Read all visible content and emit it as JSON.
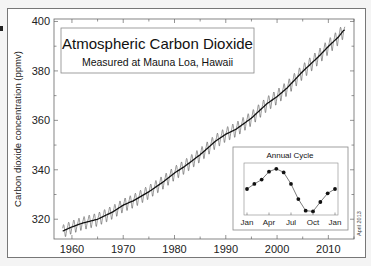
{
  "chart_data": {
    "type": "line",
    "title": "Atmospheric Carbon Dioxide",
    "subtitle": "Measured at Mauna Loa, Hawaii",
    "xlabel": "",
    "ylabel": "Carbon dioxide concentration (ppmv)",
    "xlim": [
      1956.5,
      2015
    ],
    "ylim": [
      312,
      401
    ],
    "x_ticks": [
      1960,
      1970,
      1980,
      1990,
      2000,
      2010
    ],
    "y_ticks": [
      320,
      340,
      360,
      380,
      400
    ],
    "grid": false,
    "annotation": "April 2013",
    "series": [
      {
        "name": "Trend (annual mean)",
        "style": "thick line",
        "x": [
          1958,
          1960,
          1962,
          1965,
          1968,
          1970,
          1972,
          1975,
          1978,
          1980,
          1982,
          1985,
          1988,
          1990,
          1992,
          1995,
          1998,
          2000,
          2002,
          2005,
          2008,
          2010,
          2012,
          2013
        ],
        "values": [
          315.0,
          316.9,
          318.4,
          320.0,
          323.0,
          325.7,
          327.5,
          331.1,
          335.4,
          338.7,
          341.4,
          346.1,
          351.6,
          354.4,
          356.4,
          360.9,
          366.7,
          369.6,
          373.2,
          379.8,
          385.6,
          389.9,
          393.8,
          396.5
        ]
      },
      {
        "name": "Monthly mean",
        "style": "thin seasonal oscillation",
        "seasonal_amplitude_ppm": 3.2
      }
    ],
    "inset": {
      "type": "line",
      "title": "Annual Cycle",
      "categories": [
        "Jan",
        "Feb",
        "Mar",
        "Apr",
        "May",
        "Jun",
        "Jul",
        "Aug",
        "Sep",
        "Oct",
        "Nov",
        "Dec",
        "Jan"
      ],
      "x_tick_labels": [
        "Jan",
        "Apr",
        "Jul",
        "Oct",
        "Jan"
      ],
      "values": [
        0.0,
        0.7,
        1.3,
        2.4,
        2.8,
        2.3,
        0.7,
        -1.4,
        -3.0,
        -3.1,
        -1.8,
        -0.6,
        0.0
      ],
      "markers": true
    }
  },
  "labels": {
    "title": "Atmospheric Carbon Dioxide",
    "subtitle": "Measured at Mauna Loa, Hawaii",
    "ylabel": "Carbon dioxide concentration (ppmv)",
    "inset_title": "Annual Cycle",
    "date_stamp": "April 2013"
  }
}
